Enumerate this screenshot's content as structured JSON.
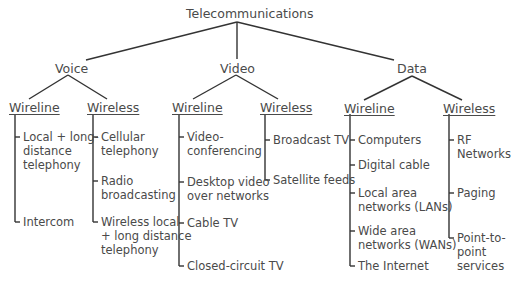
{
  "root": "Telecommunications",
  "categories": [
    {
      "label": "Voice",
      "wireline": {
        "label": "Wireline",
        "items": [
          "Local + long-\ndistance\ntelephony",
          "Intercom"
        ]
      },
      "wireless": {
        "label": "Wireless",
        "items": [
          "Cellular\ntelephony",
          "Radio\nbroadcasting",
          "Wireless local\n+ long distance\ntelephony"
        ]
      }
    },
    {
      "label": "Video",
      "wireline": {
        "label": "Wireline",
        "items": [
          "Video-\nconferencing",
          "Desktop video\nover networks",
          "Cable TV",
          "Closed-circuit TV"
        ]
      },
      "wireless": {
        "label": "Wireless",
        "items": [
          "Broadcast TV",
          "Satellite feeds"
        ]
      }
    },
    {
      "label": "Data",
      "wireline": {
        "label": "Wireline",
        "items": [
          "Computers",
          "Digital cable",
          "Local area\nnetworks (LANs)",
          "Wide area\nnetworks (WANs)",
          "The Internet"
        ]
      },
      "wireless": {
        "label": "Wireless",
        "items": [
          "RF\nNetworks",
          "Paging",
          "Point-to-\npoint\nservices"
        ]
      }
    }
  ],
  "colors": {
    "text": "#4a4a4a",
    "line": "#333333"
  }
}
